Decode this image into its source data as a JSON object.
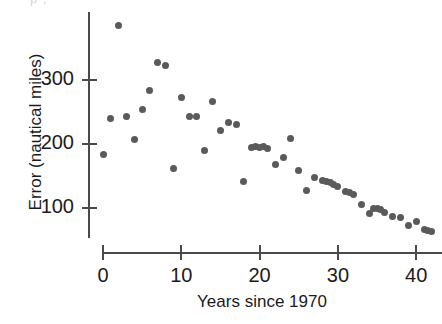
{
  "figure": {
    "top_fragment_text": "p ,",
    "marker_color": "#5a5a5a",
    "axis_color": "#4a4a4a",
    "text_color": "#1b1b1b"
  },
  "chart_data": {
    "type": "scatter",
    "title": "",
    "xlabel": "Years since 1970",
    "ylabel": "Error (nautical miles)",
    "xlim": [
      -2,
      43.5
    ],
    "ylim": [
      40,
      395
    ],
    "xticks": [
      0,
      10,
      20,
      30,
      40
    ],
    "yticks": [
      100,
      200,
      300
    ],
    "xticklabels": [
      "0",
      "10",
      "20",
      "30",
      "40"
    ],
    "yticklabels": [
      "100",
      "200",
      "300"
    ],
    "grid": false,
    "legend": null,
    "series": [
      {
        "name": "Hurricane track forecast error",
        "x": [
          0,
          1,
          2,
          3,
          4,
          5,
          6,
          7,
          8,
          9,
          10,
          11,
          12,
          13,
          14,
          15,
          16,
          17,
          18,
          19,
          19.5,
          20,
          20.5,
          21,
          22,
          23,
          24,
          25,
          26,
          27,
          28,
          28.5,
          29,
          29.5,
          30,
          31,
          31.5,
          32,
          33,
          34,
          34.5,
          35,
          35.5,
          36,
          37,
          38,
          39,
          40,
          41,
          41.5,
          42
        ],
        "y": [
          184,
          240,
          385,
          243,
          207,
          254,
          283,
          327,
          322,
          161,
          272,
          243,
          243,
          190,
          266,
          221,
          234,
          230,
          141,
          194,
          196,
          194,
          196,
          193,
          168,
          179,
          209,
          159,
          127,
          148,
          143,
          142,
          140,
          136,
          133,
          126,
          124,
          121,
          105,
          92,
          99,
          100,
          97,
          93,
          86,
          85,
          72,
          79,
          66,
          65,
          63
        ]
      }
    ]
  }
}
